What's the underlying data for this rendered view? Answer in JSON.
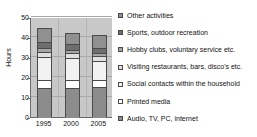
{
  "chart_data": {
    "type": "bar",
    "subtype": "stacked-vertical",
    "title": "",
    "xlabel": "",
    "ylabel": "Hours",
    "categories": [
      "1995",
      "2000",
      "2005"
    ],
    "ylim": [
      0,
      50
    ],
    "yticks": [
      0,
      10,
      20,
      30,
      40,
      50
    ],
    "grid": true,
    "legend_position": "right",
    "series": [
      {
        "name": "Audio, TV, PC, internet",
        "color": "#8c8c8c",
        "values": [
          14.3,
          14.7,
          15.2
        ]
      },
      {
        "name": "Printed media",
        "color": "#ffffff",
        "values": [
          4.3,
          4.0,
          3.3
        ]
      },
      {
        "name": "Social contacts within the household",
        "color": "#f2f2f2",
        "values": [
          11.2,
          11.0,
          9.7
        ]
      },
      {
        "name": "Visiting restaurants, bars, disco's etc.",
        "color": "#e0e0e0",
        "values": [
          2.5,
          2.2,
          2.3
        ]
      },
      {
        "name": "Hobby clubs, voluntary service etc.",
        "color": "#a5a5a5",
        "values": [
          2.0,
          1.6,
          1.5
        ]
      },
      {
        "name": "Sports, outdoor recreation",
        "color": "#6e6e6e",
        "values": [
          3.0,
          2.8,
          2.7
        ]
      },
      {
        "name": "Other activities",
        "color": "#909090",
        "values": [
          7.0,
          5.5,
          6.5
        ]
      }
    ],
    "totals": [
      44.3,
      41.8,
      41.2
    ]
  },
  "legend": {
    "items": [
      {
        "label": "Other activities",
        "color": "#909090"
      },
      {
        "label": "Sports, outdoor recreation",
        "color": "#6e6e6e"
      },
      {
        "label": "Hobby clubs, voluntary service etc.",
        "color": "#a5a5a5"
      },
      {
        "label": "Visiting restaurants, bars, disco's etc.",
        "color": "#e0e0e0"
      },
      {
        "label": "Social contacts within the household",
        "color": "#f2f2f2"
      },
      {
        "label": "Printed media",
        "color": "#ffffff"
      },
      {
        "label": "Audio, TV, PC, internet",
        "color": "#8c8c8c"
      }
    ]
  },
  "axes": {
    "y_title": "Hours",
    "y_tick_labels": [
      "50",
      "40",
      "30",
      "20",
      "10",
      "0"
    ],
    "x_tick_labels": [
      "1995",
      "2000",
      "2005"
    ]
  },
  "colors": {
    "plot_background": "#c8c8c8",
    "gridline": "#a8a8a8",
    "axis": "#6b6b6b",
    "bar_outline": "#4a4a4a",
    "text": "#111111",
    "page_background": "#ffffff"
  }
}
